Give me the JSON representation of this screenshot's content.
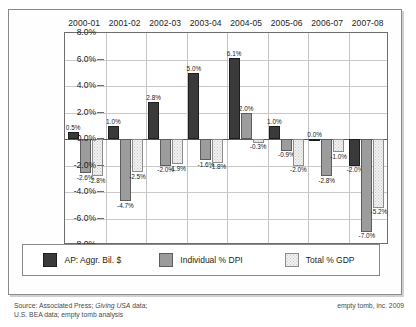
{
  "chart_data": {
    "type": "bar",
    "title": "",
    "xlabel": "",
    "ylabel": "",
    "ylim": [
      -8.0,
      8.0
    ],
    "ytick_labels": [
      "8.0%",
      "6.0%",
      "4.0%",
      "2.0%",
      "0.0%",
      "-2.0%",
      "-4.0%",
      "-6.0%",
      "-8.0%"
    ],
    "ytick_values": [
      8.0,
      6.0,
      4.0,
      2.0,
      0.0,
      -2.0,
      -4.0,
      -6.0,
      -8.0
    ],
    "grid": true,
    "legend_position": "bottom",
    "categories": [
      "2000-01",
      "2001-02",
      "2002-03",
      "2003-04",
      "2004-05",
      "2005-06",
      "2006-07",
      "2007-08"
    ],
    "series": [
      {
        "name": "AP: Aggr. Bil. $",
        "color": "#3a3a3a",
        "values": [
          0.5,
          1.0,
          2.8,
          5.0,
          6.1,
          1.0,
          0.0,
          -2.0
        ],
        "labels": [
          "0.5%",
          "1.0%",
          "2.8%",
          "5.0%",
          "6.1%",
          "1.0%",
          "0.0%",
          "-2.0%"
        ]
      },
      {
        "name": "Individual % DPI",
        "color": "#9c9c9c",
        "values": [
          -2.6,
          -4.7,
          -2.0,
          -1.6,
          2.0,
          -0.9,
          -2.8,
          -7.0
        ],
        "labels": [
          "-2.6%",
          "-4.7%",
          "-2.0%",
          "-1.6%",
          "2.0%",
          "-0.9%",
          "-2.8%",
          "-7.0%"
        ]
      },
      {
        "name": "Total % GDP",
        "color": "#f1f1f1",
        "values": [
          -2.8,
          -2.5,
          -1.9,
          -1.8,
          -0.3,
          -2.0,
          -1.0,
          -5.2
        ],
        "labels": [
          "-2.8%",
          "-2.5%",
          "-1.9%",
          "-1.8%",
          "-0.3%",
          "-2.0%",
          "-1.0%",
          "-5.2%"
        ]
      }
    ]
  },
  "legend": {
    "items": [
      {
        "label": "AP: Aggr. Bil. $",
        "swatch": "ap"
      },
      {
        "label": "Individual % DPI",
        "swatch": "ind"
      },
      {
        "label": "Total % GDP",
        "swatch": "gdp"
      }
    ]
  },
  "footer": {
    "source_line1_pre": "Source: Associated Press; ",
    "source_line1_em": "Giving USA",
    "source_line1_post": " data;",
    "source_line2": "U.S. BEA data;  empty tomb analysis",
    "copyright": "empty tomb, inc. 2009"
  }
}
